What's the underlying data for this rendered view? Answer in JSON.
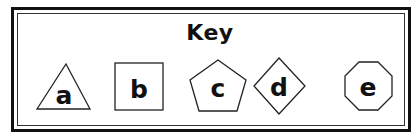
{
  "key": {
    "title": "Key",
    "items": [
      {
        "shape": "triangle",
        "label": "a"
      },
      {
        "shape": "square",
        "label": "b"
      },
      {
        "shape": "pentagon",
        "label": "c"
      },
      {
        "shape": "diamond",
        "label": "d"
      },
      {
        "shape": "octagon",
        "label": "e"
      }
    ]
  },
  "colors": {
    "stroke": "#222222",
    "background": "#ffffff",
    "text": "#111111"
  }
}
